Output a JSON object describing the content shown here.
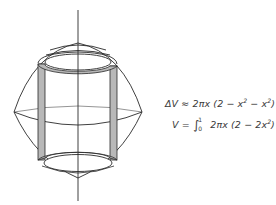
{
  "figure": {
    "shell_fill_color": "#b8b8b8",
    "line_color": "#2a2a2a"
  },
  "equations": {
    "delta_v": {
      "lhs": "ΔV",
      "rel": "≈",
      "rhs_prefix": "2πx (2 − x",
      "exp1": "2",
      "rhs_mid": " − x",
      "exp2": "2",
      "rhs_suffix": ") Δ"
    },
    "volume": {
      "lhs": "V",
      "rel": "=",
      "integral": "∫",
      "upper": "1",
      "lower": "0",
      "rhs_prefix": "2πx (2 − 2x",
      "exp": "2",
      "rhs_suffix": ") dx"
    }
  }
}
